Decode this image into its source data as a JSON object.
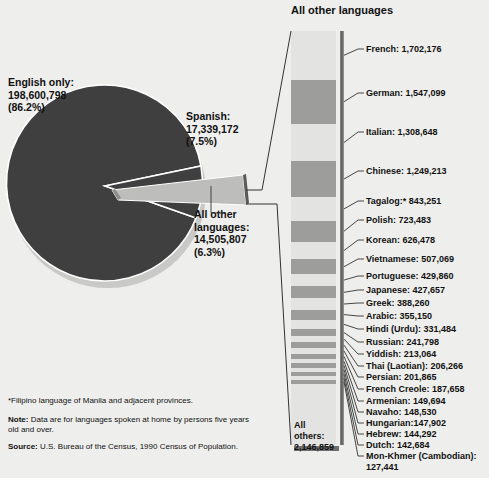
{
  "chart_data": {
    "type": "pie",
    "pie": {
      "labels": [
        "English only",
        "Spanish",
        "All other languages"
      ],
      "values": [
        198600798,
        17339172,
        14505807
      ],
      "percents": [
        86.2,
        7.5,
        6.3
      ],
      "value_labels": [
        "198,600,798",
        "17,339,172",
        "14,505,807"
      ],
      "percent_labels": [
        "(86.2%)",
        "(7.5%)",
        "(6.3%)"
      ],
      "colors": [
        "#3f3f3f",
        "#3f3f3f",
        "#bdbdbb"
      ]
    },
    "breakout": {
      "title": "All other languages",
      "type": "stacked_bar",
      "total": 14505807,
      "categories": [
        "French",
        "German",
        "Italian",
        "Chinese",
        "Tagalog*",
        "Polish",
        "Korean",
        "Vietnamese",
        "Portuguese",
        "Japanese",
        "Greek",
        "Arabic",
        "Hindi (Urdu)",
        "Russian",
        "Yiddish",
        "Thai (Laotian)",
        "Persian",
        "French Creole",
        "Armenian",
        "Navaho",
        "Hungarian",
        "Hebrew",
        "Dutch",
        "Mon-Khmer (Cambodian)",
        "All others"
      ],
      "values": [
        1702176,
        1547099,
        1308648,
        1249213,
        843251,
        723483,
        626478,
        507069,
        429860,
        427657,
        388260,
        355150,
        331484,
        241798,
        213064,
        206266,
        201865,
        187658,
        149694,
        148530,
        147902,
        144292,
        142684,
        127441,
        2146859
      ],
      "value_labels": [
        "1,702,176",
        "1,547,099",
        "1,308,648",
        "1,249,213",
        "843,251",
        "723,483",
        "626,478",
        "507,069",
        "429,860",
        "427,657",
        "388,260",
        "355,150",
        "331,484",
        "241,798",
        "213,064",
        "206,266",
        "201,865",
        "187,658",
        "149,694",
        "148,530",
        "147,902",
        "144,292",
        "142,684",
        "127,441",
        "2,146,859"
      ]
    },
    "xlabel": "",
    "ylabel": "",
    "legend": "none",
    "grid": false
  },
  "pie_labels": {
    "english": "English only:\n198,600,798\n(86.2%)",
    "spanish": "Spanish:\n17,339,172\n(7.5%)",
    "all_other": "All other\nlanguages:\n14,505,807\n(6.3%)"
  },
  "bar": {
    "title": "All other languages",
    "all_others_label": "All others:\n2,146,859",
    "items": [
      {
        "label": "French: 1,702,176"
      },
      {
        "label": "German: 1,547,099"
      },
      {
        "label": "Italian: 1,308,648"
      },
      {
        "label": "Chinese: 1,249,213"
      },
      {
        "label": "Tagalog:* 843,251"
      },
      {
        "label": "Polish: 723,483"
      },
      {
        "label": "Korean: 626,478"
      },
      {
        "label": "Vietnamese: 507,069"
      },
      {
        "label": "Portuguese: 429,860"
      },
      {
        "label": "Japanese: 427,657"
      },
      {
        "label": "Greek: 388,260"
      },
      {
        "label": "Arabic: 355,150"
      },
      {
        "label": "Hindi (Urdu): 331,484"
      },
      {
        "label": "Russian: 241,798"
      },
      {
        "label": "Yiddish: 213,064"
      },
      {
        "label": "Thai (Laotian): 206,266"
      },
      {
        "label": "Persian: 201,865"
      },
      {
        "label": "French Creole: 187,658"
      },
      {
        "label": "Armenian: 149,694"
      },
      {
        "label": "Navaho: 148,530"
      },
      {
        "label": "Hungarian:147,902"
      },
      {
        "label": "Hebrew: 144,292"
      },
      {
        "label": "Dutch: 142,684"
      },
      {
        "label": "Mon-Khmer (Cambodian): 127,441"
      }
    ]
  },
  "notes": {
    "asterisk": "*Filipino language of Manila and adjacent provinces.",
    "note_label": "Note:",
    "note_text": " Data are for languages spoken at home by persons five years old and over.",
    "source_label": "Source:",
    "source_text": " U.S. Bureau of the Census, 1990 Census of Population."
  },
  "colors": {
    "background": "#eeeeec",
    "pie_dark": "#3f3f3f",
    "pie_light": "#bdbdbb",
    "bar_band_dark": "#9d9d9b",
    "bar_band_light": "#e3e3e1",
    "rail": "#5d5d5d",
    "text": "#111111"
  }
}
